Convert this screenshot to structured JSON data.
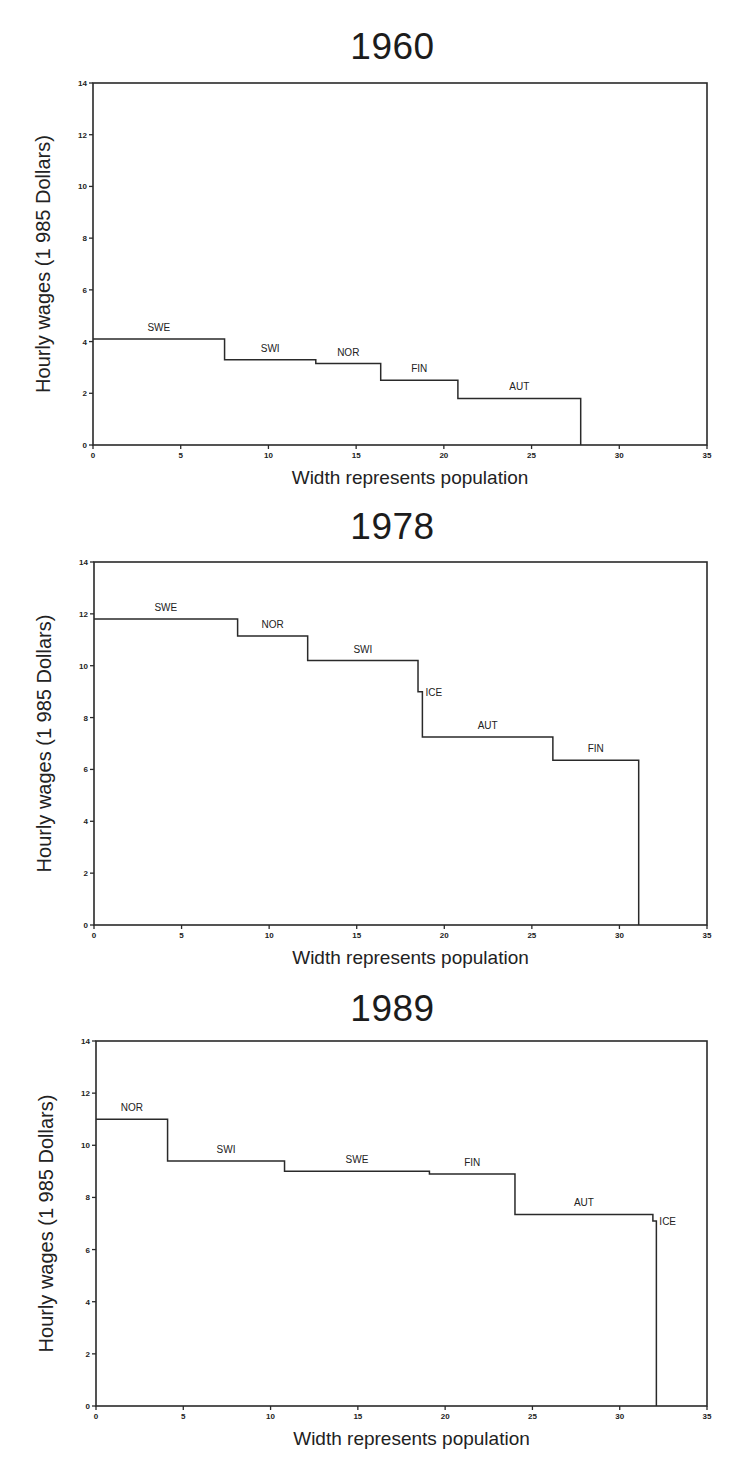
{
  "chart_data": [
    {
      "type": "bar",
      "subtype": "variable-width step chart",
      "title": "1960",
      "xlabel": "Width represents population",
      "ylabel": "Hourly wages (1 985 Dollars)",
      "xlim": [
        0,
        35
      ],
      "ylim": [
        0,
        14
      ],
      "xticks": [
        0,
        5,
        10,
        15,
        20,
        25,
        30,
        35
      ],
      "yticks": [
        0,
        2,
        4,
        6,
        8,
        10,
        12,
        14
      ],
      "grid": false,
      "legend": "none (inline segment labels)",
      "series": [
        {
          "name": "SWE",
          "x_start": 0.0,
          "x_end": 7.5,
          "value": 4.1
        },
        {
          "name": "SWI",
          "x_start": 7.5,
          "x_end": 12.7,
          "value": 3.3
        },
        {
          "name": "NOR",
          "x_start": 12.7,
          "x_end": 16.4,
          "value": 3.15
        },
        {
          "name": "FIN",
          "x_start": 16.4,
          "x_end": 20.8,
          "value": 2.5
        },
        {
          "name": "AUT",
          "x_start": 20.8,
          "x_end": 27.8,
          "value": 1.8
        }
      ]
    },
    {
      "type": "bar",
      "subtype": "variable-width step chart",
      "title": "1978",
      "xlabel": "Width represents population",
      "ylabel": "Hourly wages (1 985 Dollars)",
      "xlim": [
        0,
        35
      ],
      "ylim": [
        0,
        14
      ],
      "xticks": [
        0,
        5,
        10,
        15,
        20,
        25,
        30,
        35
      ],
      "yticks": [
        0,
        2,
        4,
        6,
        8,
        10,
        12,
        14
      ],
      "grid": false,
      "legend": "none (inline segment labels)",
      "series": [
        {
          "name": "SWE",
          "x_start": 0.0,
          "x_end": 8.2,
          "value": 11.8
        },
        {
          "name": "NOR",
          "x_start": 8.2,
          "x_end": 12.2,
          "value": 11.15
        },
        {
          "name": "SWI",
          "x_start": 12.2,
          "x_end": 18.5,
          "value": 10.2
        },
        {
          "name": "ICE",
          "x_start": 18.5,
          "x_end": 18.75,
          "value": 9.0
        },
        {
          "name": "AUT",
          "x_start": 18.75,
          "x_end": 26.2,
          "value": 7.25
        },
        {
          "name": "FIN",
          "x_start": 26.2,
          "x_end": 31.1,
          "value": 6.35
        }
      ]
    },
    {
      "type": "bar",
      "subtype": "variable-width step chart",
      "title": "1989",
      "xlabel": "Width represents population",
      "ylabel": "Hourly wages (1 985 Dollars)",
      "xlim": [
        0,
        35
      ],
      "ylim": [
        0,
        14
      ],
      "xticks": [
        0,
        5,
        10,
        15,
        20,
        25,
        30,
        35
      ],
      "yticks": [
        0,
        2,
        4,
        6,
        8,
        10,
        12,
        14
      ],
      "grid": false,
      "legend": "none (inline segment labels)",
      "series": [
        {
          "name": "NOR",
          "x_start": 0.0,
          "x_end": 4.1,
          "value": 11.0
        },
        {
          "name": "SWI",
          "x_start": 4.1,
          "x_end": 10.8,
          "value": 9.4
        },
        {
          "name": "SWE",
          "x_start": 10.8,
          "x_end": 19.1,
          "value": 9.0
        },
        {
          "name": "FIN",
          "x_start": 19.1,
          "x_end": 24.0,
          "value": 8.9
        },
        {
          "name": "AUT",
          "x_start": 24.0,
          "x_end": 31.9,
          "value": 7.35
        },
        {
          "name": "ICE",
          "x_start": 31.9,
          "x_end": 32.1,
          "value": 7.1
        }
      ]
    }
  ]
}
